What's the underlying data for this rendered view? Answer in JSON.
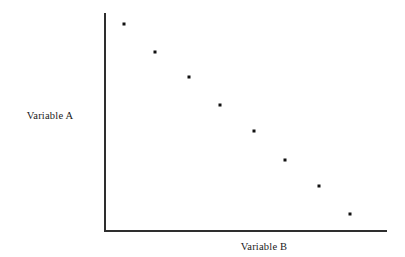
{
  "figure": {
    "background_color": "#ffffff",
    "axis_color": "#2e2e2e",
    "point_color": "#111111",
    "text_color": "#1a1a1a"
  },
  "labels": {
    "y_axis": "Variable A",
    "x_axis": "Variable B"
  },
  "chart_data": {
    "type": "scatter",
    "title": "",
    "subtitle": "",
    "xlabel": "Variable B",
    "ylabel": "Variable A",
    "xlim": [
      0,
      100
    ],
    "ylim": [
      0,
      100
    ],
    "grid": false,
    "legend": false,
    "legend_position": "none",
    "xticks": [],
    "yticks": [],
    "xticklabels": [],
    "yticklabels": [],
    "marker": "square",
    "marker_size_px": 3,
    "annotations": [],
    "series": [
      {
        "name": "Variable A vs Variable B",
        "color": "#111111",
        "points": [
          {
            "x": 7,
            "y": 95
          },
          {
            "x": 18,
            "y": 82
          },
          {
            "x": 30,
            "y": 71
          },
          {
            "x": 41,
            "y": 58
          },
          {
            "x": 53,
            "y": 46
          },
          {
            "x": 64,
            "y": 33
          },
          {
            "x": 76,
            "y": 21
          },
          {
            "x": 87,
            "y": 8
          }
        ]
      }
    ],
    "trend": "negative",
    "n_points": 8
  }
}
